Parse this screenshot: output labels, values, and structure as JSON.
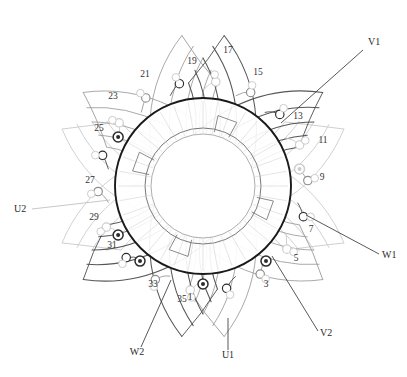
{
  "diagram": {
    "type": "stator-winding-schematic",
    "slot_count": 36,
    "phase_count": 3
  },
  "colors": {
    "core_outline": "#1a1a1a",
    "core_inner": "#555555",
    "phase_u": "#c9c9c9",
    "phase_v": "#9a9a9a",
    "phase_w": "#4d4d4d",
    "terminal_dark": "#2b2b2b",
    "terminal_mid": "#8c8c8c",
    "terminal_light": "#cccccc",
    "leader_dark": "#3a3a3a",
    "leader_light": "#bdbdbd",
    "text": "#333333",
    "background": "#ffffff"
  },
  "geometry": {
    "center_x": 203,
    "center_y": 186,
    "core_outer_radius": 88,
    "core_inner_radius": 58,
    "core_bore_radius": 52,
    "slot_ring_radius": 96,
    "slot_angle_step": 10
  },
  "slot_numbers": [
    {
      "label": "1",
      "x": 190,
      "y": 300
    },
    {
      "label": "3",
      "x": 266,
      "y": 287
    },
    {
      "label": "5",
      "x": 296,
      "y": 261
    },
    {
      "label": "7",
      "x": 311,
      "y": 232
    },
    {
      "label": "9",
      "x": 322,
      "y": 180
    },
    {
      "label": "11",
      "x": 323,
      "y": 143
    },
    {
      "label": "13",
      "x": 298,
      "y": 119
    },
    {
      "label": "15",
      "x": 258,
      "y": 75
    },
    {
      "label": "17",
      "x": 228,
      "y": 53
    },
    {
      "label": "19",
      "x": 192,
      "y": 64
    },
    {
      "label": "21",
      "x": 145,
      "y": 77
    },
    {
      "label": "23",
      "x": 113,
      "y": 99
    },
    {
      "label": "25",
      "x": 99,
      "y": 131
    },
    {
      "label": "27",
      "x": 90,
      "y": 183
    },
    {
      "label": "29",
      "x": 94,
      "y": 220
    },
    {
      "label": "31",
      "x": 112,
      "y": 248
    },
    {
      "label": "33",
      "x": 153,
      "y": 287
    },
    {
      "label": "35",
      "x": 182,
      "y": 302
    }
  ],
  "phase_terminals": [
    {
      "label": "V1",
      "x": 368,
      "y": 45,
      "anchor": "start",
      "leader": {
        "x1": 363,
        "y1": 50,
        "x2": 281,
        "y2": 123
      },
      "tone": "dark",
      "target_slot": "13"
    },
    {
      "label": "W1",
      "x": 382,
      "y": 258,
      "anchor": "start",
      "leader": {
        "x1": 379,
        "y1": 254,
        "x2": 306,
        "y2": 215
      },
      "tone": "dark",
      "target_slot": "7"
    },
    {
      "label": "V2",
      "x": 320,
      "y": 336,
      "anchor": "start",
      "leader": {
        "x1": 318,
        "y1": 331,
        "x2": 272,
        "y2": 256
      },
      "tone": "dark",
      "target_slot": "5"
    },
    {
      "label": "U1",
      "x": 228,
      "y": 358,
      "anchor": "middle",
      "leader": {
        "x1": 228,
        "y1": 350,
        "x2": 228,
        "y2": 318
      },
      "tone": "dark",
      "target_slot": "1"
    },
    {
      "label": "W2",
      "x": 137,
      "y": 355,
      "anchor": "middle",
      "leader": {
        "x1": 141,
        "y1": 347,
        "x2": 171,
        "y2": 280
      },
      "tone": "dark",
      "target_slot": "33"
    },
    {
      "label": "U2",
      "x": 14,
      "y": 212,
      "anchor": "start",
      "leader": {
        "x1": 32,
        "y1": 209,
        "x2": 110,
        "y2": 200
      },
      "tone": "light",
      "target_slot": "27"
    }
  ],
  "phases": [
    {
      "name": "U",
      "tone": "light",
      "start_terminal": "U1",
      "end_terminal": "U2"
    },
    {
      "name": "V",
      "tone": "mid",
      "start_terminal": "V1",
      "end_terminal": "V2"
    },
    {
      "name": "W",
      "tone": "dark",
      "start_terminal": "W1",
      "end_terminal": "W2"
    }
  ]
}
